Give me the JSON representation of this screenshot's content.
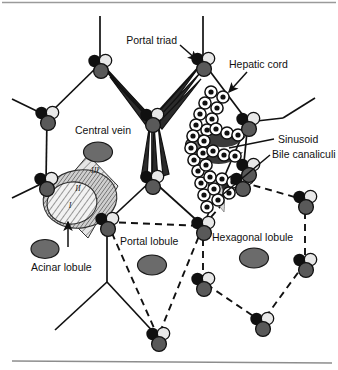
{
  "figure": {
    "background_color": "#ffffff",
    "top_rule_color": "#9a9a9a",
    "bottom_rule_color": "#8d8d8d",
    "width": 338,
    "height": 370
  },
  "labels": {
    "portal_triad": "Portal triad",
    "hepatic_cord": "Hepatic cord",
    "central_vein": "Central vein",
    "sinusoid": "Sinusoid",
    "bile_canaliculi": "Bile canaliculi",
    "acinar_lobule": "Acinar lobule",
    "portal_lobule": "Portal lobule",
    "hexagonal_lobule": "Hexagonal lobule"
  },
  "acinar_zones": {
    "zone_1": "I",
    "zone_2": "II",
    "zone_3": "III"
  },
  "colors": {
    "hepatic_artery": "#101010",
    "portal_vein": "#595959",
    "bile_duct": "#e8e8e8",
    "central_vein_fill": "#6b6b6b",
    "sinusoid_fill": "#3a3a3a",
    "hepatocyte_outline": "#111111",
    "hepatocyte_fill": "#ffffff",
    "hepatocyte_nucleus": "#101010",
    "zone_1_fill": "#f0f0f0",
    "zone_2_fill": "#c8c8c8",
    "zone_3_fill": "#dcdcdc",
    "solid_lobule_line": "#111111",
    "dashed_lobule_line": "#111111",
    "text": "#111111"
  },
  "structures": {
    "portal_triad_components": [
      "hepatic artery",
      "portal vein",
      "bile duct"
    ],
    "lobule_models": [
      "Hexagonal lobule",
      "Portal lobule",
      "Acinar lobule"
    ],
    "acinar_zone_count": 3
  }
}
